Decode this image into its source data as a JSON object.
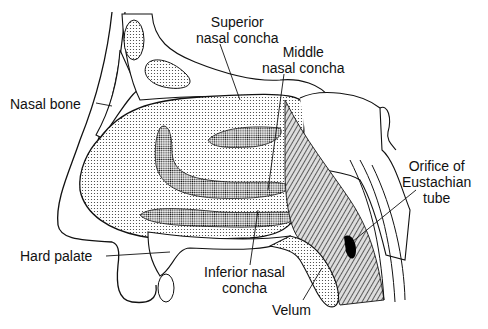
{
  "diagram": {
    "labels": {
      "superior_l1": "Superior",
      "superior_l2": "nasal concha",
      "middle_l1": "Middle",
      "middle_l2": "nasal concha",
      "nasal_bone": "Nasal bone",
      "orifice_l1": "Orifice of",
      "orifice_l2": "Eustachian",
      "orifice_l3": "tube",
      "hard_palate": "Hard palate",
      "inferior_l1": "Inferior nasal",
      "inferior_l2": "concha",
      "velum": "Velum"
    }
  }
}
